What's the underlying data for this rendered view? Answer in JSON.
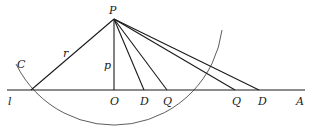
{
  "diagram": {
    "type": "geometry",
    "colors": {
      "ink": "#1a1a1a",
      "background": "#ffffff"
    },
    "points": {
      "P": {
        "label": "P",
        "x": 114,
        "y": 19
      },
      "O": {
        "label": "O",
        "x": 114,
        "y": 90
      },
      "X": {
        "label": "",
        "x": 31,
        "y": 90
      },
      "D1": {
        "label": "D",
        "x": 144,
        "y": 90
      },
      "Q1": {
        "label": "Q",
        "x": 167,
        "y": 90
      },
      "Q2": {
        "label": "Q",
        "x": 235,
        "y": 90
      },
      "D2": {
        "label": "D",
        "x": 259,
        "y": 90
      }
    },
    "labels": {
      "P": "P",
      "r": "r",
      "C": "C",
      "p": "p",
      "l": "l",
      "O": "O",
      "D1": "D",
      "Q1": "Q",
      "Q2": "Q",
      "D2": "D",
      "A": "A"
    },
    "segments": [
      {
        "from": "P",
        "to": "X",
        "label": "r"
      },
      {
        "from": "P",
        "to": "O",
        "label": "p"
      },
      {
        "from": "P",
        "to": "D1"
      },
      {
        "from": "P",
        "to": "Q1"
      },
      {
        "from": "P",
        "to": "Q2"
      },
      {
        "from": "P",
        "to": "D2"
      }
    ],
    "line": {
      "name": "l",
      "end_label": "A"
    },
    "arc": {
      "name": "C",
      "center": "P",
      "radius": "r"
    }
  }
}
